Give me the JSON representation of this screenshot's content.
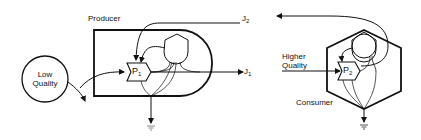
{
  "diagram": {
    "producer": {
      "label": "Producer",
      "process_label": "P",
      "process_sub": "1"
    },
    "consumer": {
      "label": "Consumer",
      "process_label": "P",
      "process_sub": "2"
    },
    "input_low": {
      "line1": "Low",
      "line2": "Quality"
    },
    "input_high": {
      "line1": "Higher",
      "line2": "Quality"
    },
    "flows": [
      {
        "label": "J",
        "sub": "1"
      },
      {
        "label": "J",
        "sub": "2"
      }
    ],
    "colors": {
      "stroke": "#111111",
      "ground": "#888888"
    }
  }
}
